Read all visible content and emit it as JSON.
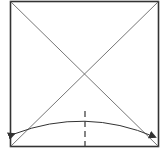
{
  "diagram": {
    "type": "origami-fold-step",
    "colors": {
      "paper_edge": "#333333",
      "crease": "#555555",
      "fold_line": "#444444",
      "arrow": "#333333",
      "background": "#ffffff"
    },
    "square": {
      "x": 10,
      "y": 2,
      "size": 148
    },
    "creases": [
      {
        "name": "diagonal-top-left-to-bottom-right",
        "x1": 10,
        "y1": 2,
        "x2": 158,
        "y2": 146
      },
      {
        "name": "diagonal-top-right-to-bottom-left",
        "x1": 158,
        "y1": 2,
        "x2": 10,
        "y2": 146
      }
    ],
    "fold_line": {
      "style": "dashed",
      "x": 85,
      "y1": 111,
      "y2": 146
    },
    "arrow": {
      "style": "curved-double-headed",
      "start": [
        13,
        135
      ],
      "control": [
        85,
        108
      ],
      "end": [
        156,
        138
      ]
    }
  }
}
